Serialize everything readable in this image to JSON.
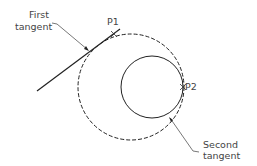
{
  "labels": {
    "first_tangent_line1": "First",
    "first_tangent_line2": "tangent",
    "p1": "P1",
    "p2": "P2",
    "second_tangent_line1": "Second",
    "second_tangent_line2": "tangent"
  },
  "colors": {
    "stroke": "#222222",
    "text": "#444444",
    "leader": "#555555"
  }
}
